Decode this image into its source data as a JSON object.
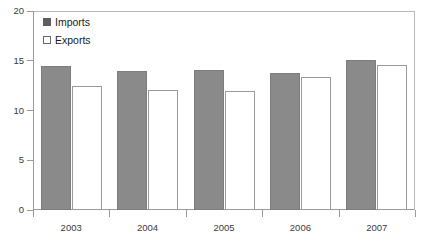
{
  "chart_data": {
    "type": "bar",
    "title": "",
    "subtitle": "",
    "xlabel": "",
    "ylabel": "",
    "categories": [
      "2003",
      "2004",
      "2005",
      "2006",
      "2007"
    ],
    "series": [
      {
        "name": "Imports",
        "values": [
          14.5,
          14.0,
          14.1,
          13.8,
          15.1
        ],
        "color": "#8a8a8a"
      },
      {
        "name": "Exports",
        "values": [
          12.5,
          12.1,
          12.0,
          13.4,
          14.6
        ],
        "color": "#ffffff"
      }
    ],
    "ylim": [
      0,
      20
    ],
    "yticks": [
      0,
      5,
      10,
      15,
      20
    ],
    "ytick_labels": [
      "0",
      "5",
      "10",
      "15",
      "20"
    ],
    "grid": false,
    "legend_position": "top-left",
    "annotations": []
  },
  "legend": {
    "entries": [
      {
        "label": "Imports",
        "swatch": "filled-gray-square"
      },
      {
        "label": "Exports",
        "swatch": "outlined-white-square"
      }
    ]
  },
  "colors": {
    "imports_fill": "#8a8a8a",
    "imports_stroke": "#7d7d7d",
    "exports_fill": "#ffffff",
    "exports_stroke": "#9a9a9a",
    "axis": "#9a9a9a",
    "frame": "#b8b8b8",
    "text": "#3b3b3b",
    "background": "#ffffff"
  }
}
